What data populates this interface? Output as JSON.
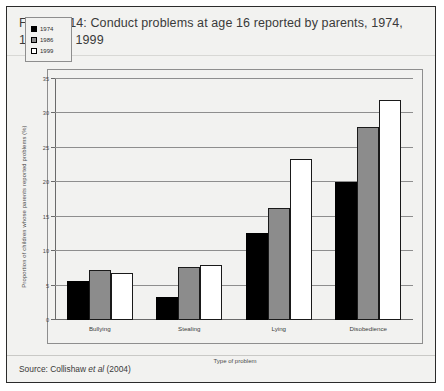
{
  "figure": {
    "title": "Figure 2.14: Conduct problems at age 16 reported by parents, 1974, 1986 and 1999",
    "source_prefix": "Source: Collishaw ",
    "source_italic": "et al",
    "source_suffix": " (2004)"
  },
  "chart_data": {
    "type": "bar",
    "title": "Conduct problems at age 16 reported by parents, 1974, 1986 and 1999",
    "categories": [
      "Bullying",
      "Stealing",
      "Lying",
      "Disobedience"
    ],
    "series": [
      {
        "name": "1974",
        "color": "#000000",
        "values": [
          5.6,
          3.4,
          12.7,
          20.0
        ]
      },
      {
        "name": "1986",
        "color": "#8c8c8c",
        "values": [
          7.3,
          7.7,
          16.3,
          28.0
        ]
      },
      {
        "name": "1999",
        "color": "#ffffff",
        "values": [
          6.9,
          8.0,
          23.4,
          32.0
        ]
      }
    ],
    "xlabel": "Type of problem",
    "ylabel": "Proportion of children whose parents reported problems (%)",
    "ylim": [
      0,
      35
    ],
    "yticks": [
      0,
      5,
      10,
      15,
      20,
      25,
      30,
      35
    ],
    "grid": true,
    "legend_position": "top-left"
  }
}
